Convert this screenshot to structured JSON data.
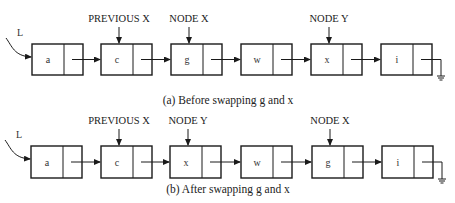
{
  "diagrams": [
    {
      "id": "before",
      "caption": "(a) Before swapping g and x",
      "head_label": "L",
      "nodes": [
        "a",
        "c",
        "g",
        "w",
        "x",
        "i"
      ],
      "pointers": [
        {
          "label": "PREVIOUS X",
          "node_index": 1
        },
        {
          "label": "NODE X",
          "node_index": 2
        },
        {
          "label": "NODE Y",
          "node_index": 4
        }
      ],
      "null_terminator": "ground-icon"
    },
    {
      "id": "after",
      "caption": "(b) After swapping g and x",
      "head_label": "L",
      "nodes": [
        "a",
        "c",
        "x",
        "w",
        "g",
        "i"
      ],
      "pointers": [
        {
          "label": "PREVIOUS X",
          "node_index": 1
        },
        {
          "label": "NODE Y",
          "node_index": 2
        },
        {
          "label": "NODE X",
          "node_index": 4
        }
      ],
      "null_terminator": "ground-icon"
    }
  ],
  "colors": {
    "stroke": "#1a1a1a",
    "text": "#222222",
    "background": "#ffffff"
  }
}
